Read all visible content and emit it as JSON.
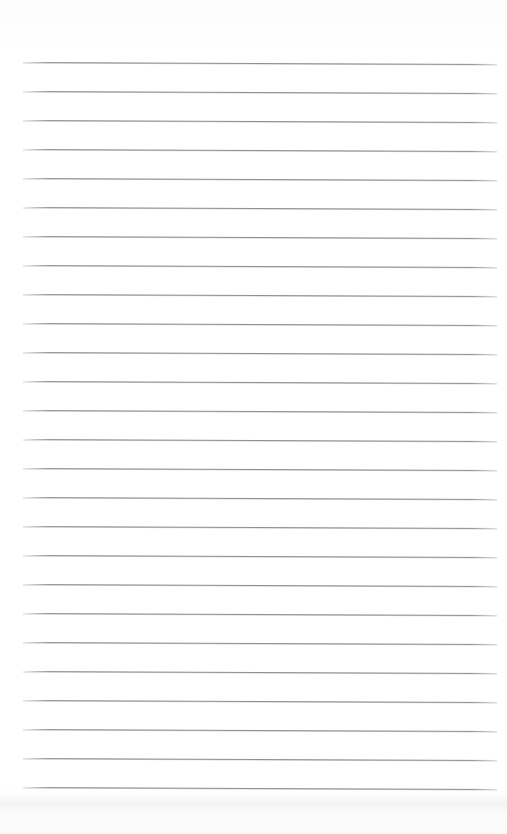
{
  "document": {
    "type": "scanned-lined-paper",
    "title": "",
    "body_text": "",
    "page_width": 507,
    "page_height": 834,
    "background_color": "#ffffff"
  },
  "ruling": {
    "line_color": "#8d8f91",
    "line_thickness_px": 1,
    "line_count": 26,
    "first_line_y": 62,
    "line_spacing_px": 29,
    "left_margin_x": 23,
    "right_margin_x": 497,
    "tilt_degrees": 0.24,
    "top_margin_px": 62,
    "bottom_margin_px": 46
  },
  "artifacts": {
    "page_edge_shadow_y": 806,
    "page_edge_shadow_color": "#ececec"
  },
  "content": {
    "written_lines": [
      "",
      "",
      "",
      "",
      "",
      "",
      "",
      "",
      "",
      "",
      "",
      "",
      "",
      "",
      "",
      "",
      "",
      "",
      "",
      "",
      "",
      "",
      "",
      "",
      "",
      ""
    ]
  }
}
